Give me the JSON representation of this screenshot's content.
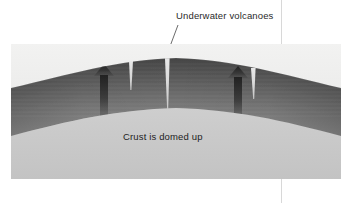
{
  "figure": {
    "background_color": "#ffffff"
  },
  "labels": {
    "volcanoes": "Underwater volcanoes",
    "domed": "Crust is domed up"
  },
  "panel": {
    "water_color_top": "#f0f0ef",
    "water_color_bottom": "#e3e3e2",
    "crust_color_dark": "#4a4a4a",
    "crust_color_light": "#8d8d8d",
    "mantle_color": "#c9c9c9",
    "fissure_color": "#dcdcdc",
    "arrow_color": "#2e2e2e",
    "guide_line_color": "#d8d8d8",
    "leader_line_color": "#5a5a5a"
  },
  "annotations": {
    "arrow_left_name": "upward magma arrow left",
    "arrow_right_name": "upward magma arrow right",
    "fissure_left_name": "volcanic fissure left",
    "fissure_center_name": "volcanic fissure center",
    "fissure_right_name": "volcanic fissure right"
  }
}
